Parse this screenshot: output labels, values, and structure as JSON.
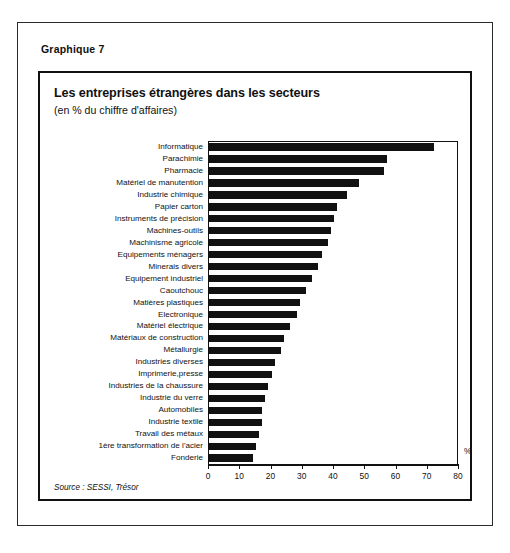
{
  "figure": {
    "number_label": "Graphique 7",
    "title": "Les entreprises étrangères dans les secteurs",
    "subtitle": "(en %  du chiffre d'affaires)",
    "source": "Source : SESSI, Trésor",
    "unit_label": "%"
  },
  "chart_data": {
    "type": "bar",
    "orientation": "horizontal",
    "title": "Les entreprises étrangères dans les secteurs",
    "subtitle": "(en %  du chiffre d'affaires)",
    "xlabel": "%",
    "ylabel": "",
    "xlim": [
      0,
      80
    ],
    "xticks": [
      0,
      10,
      20,
      30,
      40,
      50,
      60,
      70,
      80
    ],
    "xtick_labels": [
      "0",
      "10",
      "20",
      "30",
      "40",
      "50",
      "60",
      "70",
      "80"
    ],
    "grid": false,
    "legend": "none",
    "bar_color": "#111111",
    "categories": [
      "Informatique",
      "Parachimie",
      "Pharmacie",
      "Matériel de manutention",
      "Industrie chimique",
      "Papier carton",
      "Instruments de précision",
      "Machines-outils",
      "Machinisme agricole",
      "Equipements ménagers",
      "Minerais divers",
      "Equipement industriel",
      "Caoutchouc",
      "Matières plastiques",
      "Electronique",
      "Matériel électrique",
      "Matériaux de construction",
      "Métallurgie",
      "Industries diverses",
      "Imprimerie,presse",
      "Industries de la chaussure",
      "Industrie du verre",
      "Automobiles",
      "Industrie textile",
      "Travail des métaux",
      "1ère transformation de l'acier",
      "Fonderie"
    ],
    "values": [
      72,
      57,
      56,
      48,
      44,
      41,
      40,
      39,
      38,
      36,
      35,
      33,
      31,
      29,
      28,
      26,
      24,
      23,
      21,
      20,
      19,
      18,
      17,
      17,
      16,
      15,
      14
    ]
  }
}
